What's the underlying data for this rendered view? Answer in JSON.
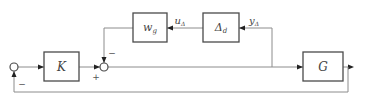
{
  "diagram": {
    "type": "block-diagram",
    "blocks": {
      "K": {
        "label": "K"
      },
      "G": {
        "label": "G"
      },
      "wg": {
        "label": "w",
        "subscript": "g"
      },
      "delta": {
        "label": "Δ",
        "subscript": "d"
      }
    },
    "signals": {
      "u_delta": {
        "label": "u",
        "subscript": "Δ"
      },
      "y_delta": {
        "label": "y",
        "subscript": "Δ"
      }
    },
    "signs": {
      "sum1_feedback": "−",
      "sum2_top": "−",
      "sum2_left": "+"
    }
  }
}
